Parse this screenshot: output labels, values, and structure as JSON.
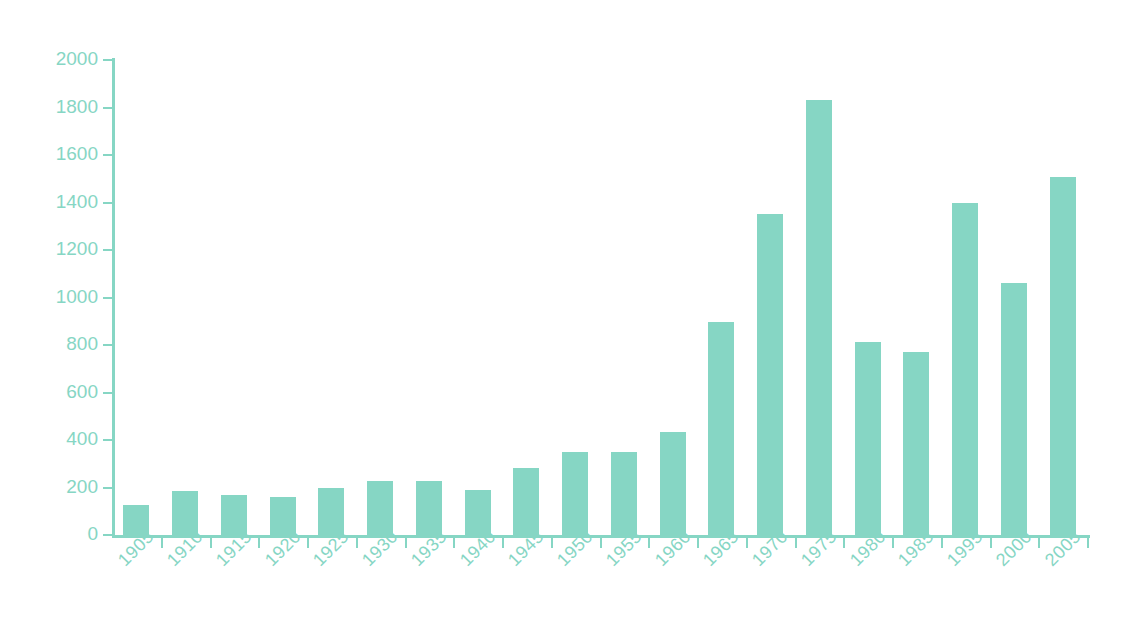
{
  "chart_data": {
    "type": "bar",
    "title": "",
    "subtitle": "",
    "xlabel": "",
    "ylabel": "",
    "categories": [
      "1905",
      "1910",
      "1915",
      "1920",
      "1925",
      "1930",
      "1935",
      "1940",
      "1945",
      "1950",
      "1955",
      "1960",
      "1965",
      "1970",
      "1975",
      "1980",
      "1985",
      "1995",
      "2000",
      "2005"
    ],
    "values": [
      126,
      185,
      168,
      158,
      200,
      228,
      228,
      188,
      282,
      350,
      350,
      432,
      898,
      1352,
      1830,
      812,
      770,
      1396,
      1062,
      1508
    ],
    "ylim": [
      0,
      2000
    ],
    "ytick_values": [
      0,
      200,
      400,
      600,
      800,
      1000,
      1200,
      1400,
      1600,
      1800,
      2000
    ],
    "ytick_labels": [
      "0",
      "200",
      "400",
      "600",
      "800",
      "1000",
      "1200",
      "1400",
      "1600",
      "1800",
      "2000"
    ],
    "grid": false,
    "legend": null,
    "legend_position": "none",
    "bar_color": "#86d6c4",
    "axis_color": "#86d6c4",
    "tick_label_color": "#86d6c4",
    "background_color": "#ffffff",
    "xtick_label_rotation": -45
  }
}
